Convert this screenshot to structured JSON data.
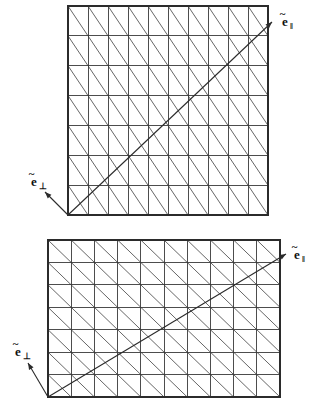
{
  "figure": {
    "background_color": "#ffffff",
    "line_color": "#3a3a3a",
    "diagonal_color": "#555555",
    "label_color": "#111111",
    "width": 319,
    "height": 408
  },
  "panels": [
    {
      "id": "top-panel",
      "name": "upper-mesh",
      "grid": {
        "columns": 10,
        "rows": 7,
        "x": 68,
        "y": 6,
        "width": 200,
        "height": 209,
        "cell_width": 20,
        "cell_height": 29.857,
        "diagonal_direction": "nw-se"
      },
      "axes": [
        {
          "name": "e-parallel",
          "base": "e",
          "tilde": "~",
          "subscript": "‖",
          "label_x": 282,
          "label_y": 26,
          "arrow_from_x": 68,
          "arrow_from_y": 215,
          "arrow_to_x": 272,
          "arrow_to_y": 22
        },
        {
          "name": "e-perp",
          "base": "e",
          "tilde": "~",
          "subscript": "⊥",
          "label_x": 31,
          "label_y": 186,
          "arrow_from_x": 68,
          "arrow_from_y": 215,
          "arrow_to_x": 45,
          "arrow_to_y": 192
        }
      ]
    },
    {
      "id": "bottom-panel",
      "name": "lower-mesh",
      "grid": {
        "columns": 10,
        "rows": 7,
        "x": 48,
        "y": 240,
        "width": 232,
        "height": 157,
        "cell_width": 23.2,
        "cell_height": 22.428,
        "diagonal_direction": "nw-se"
      },
      "axes": [
        {
          "name": "e-parallel",
          "base": "e",
          "tilde": "~",
          "subscript": "‖",
          "label_x": 294,
          "label_y": 259,
          "arrow_from_x": 48,
          "arrow_from_y": 397,
          "arrow_to_x": 286,
          "arrow_to_y": 254
        },
        {
          "name": "e-perp",
          "base": "e",
          "tilde": "~",
          "subscript": "⊥",
          "label_x": 15,
          "label_y": 356,
          "arrow_from_x": 48,
          "arrow_from_y": 397,
          "arrow_to_x": 28,
          "arrow_to_y": 363
        }
      ]
    }
  ],
  "labels": {
    "e_parallel_top": "ẽ‖",
    "e_perp_top": "ẽ⊥",
    "e_parallel_bottom": "ẽ‖",
    "e_perp_bottom": "ẽ⊥"
  }
}
